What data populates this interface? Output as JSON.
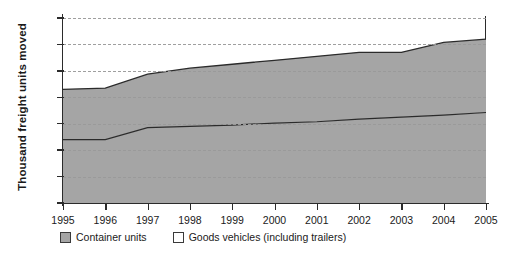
{
  "chart_data": {
    "type": "area",
    "stacked": true,
    "title": "",
    "xlabel": "",
    "ylabel": "Thousand freight units moved",
    "x": [
      1995,
      1996,
      1997,
      1998,
      1999,
      2000,
      2001,
      2002,
      2003,
      2004,
      2005
    ],
    "xtick_labels": [
      "1995",
      "1996",
      "1997",
      "1998",
      "1999",
      "2000",
      "2001",
      "2002",
      "2003",
      "2004",
      "2005"
    ],
    "ytick_labels": [
      "0",
      "2,000",
      "4,000",
      "6,000",
      "8,000",
      "10,000",
      "12,000",
      "14,000"
    ],
    "ytick_values": [
      0,
      2000,
      4000,
      6000,
      8000,
      10000,
      12000,
      14000
    ],
    "ylim": [
      0,
      14000
    ],
    "xlim": [
      1995,
      2005
    ],
    "grid": true,
    "grid_style": "dashed-horizontal",
    "legend_position": "bottom-left",
    "series": [
      {
        "name": "Container units",
        "color": "#a5a5a5",
        "swatch": "filled",
        "values": [
          4800,
          4800,
          5700,
          5800,
          5900,
          6050,
          6150,
          6350,
          6500,
          6650,
          6850
        ]
      },
      {
        "name": "Goods vehicles (including trailers)",
        "color": "#a5a5a5",
        "swatch": "hollow",
        "values": [
          3800,
          3900,
          4050,
          4400,
          4600,
          4750,
          4950,
          5050,
          4900,
          5500,
          5550
        ]
      }
    ],
    "cumulative_totals": [
      8600,
      8700,
      9750,
      10200,
      10500,
      10800,
      11100,
      11400,
      11400,
      12150,
      12400
    ]
  },
  "legend": {
    "items": [
      {
        "label": "Container units",
        "swatch": "filled"
      },
      {
        "label": "Goods vehicles (including trailers)",
        "swatch": "hollow"
      }
    ]
  },
  "colors": {
    "band_fill": "#a5a5a5",
    "line": "#2b2b2b",
    "grid": "#9a9a9a",
    "background": "#ffffff"
  }
}
